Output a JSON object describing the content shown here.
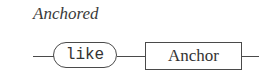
{
  "diagram": {
    "title": "Anchored",
    "type": "railroad-syntax-diagram",
    "nodes": [
      {
        "kind": "terminal",
        "shape": "rounded",
        "label": "like"
      },
      {
        "kind": "nonterminal",
        "shape": "rectangle",
        "label": "Anchor"
      }
    ],
    "colors": {
      "stroke": "#4a4a4a",
      "text": "#333333",
      "background": "#ffffff"
    }
  }
}
